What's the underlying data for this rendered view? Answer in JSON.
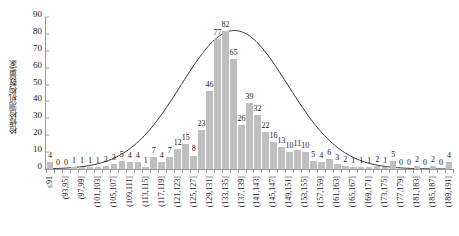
{
  "chart_data": {
    "type": "bar",
    "title": "",
    "xlabel": "",
    "ylabel": "检修检测机构数量/家",
    "ylim": [
      0,
      90
    ],
    "yticks": [
      0,
      10,
      20,
      30,
      40,
      50,
      60,
      70,
      80,
      90
    ],
    "grid": false,
    "legend": null,
    "bar_color": "#bfbfbf",
    "curve_color": "#333333",
    "categories": [
      "≤91",
      "(91,93]",
      "(93,95]",
      "(95,97]",
      "(97,99]",
      "(99,101]",
      "(101,103]",
      "(103,105]",
      "(105,107]",
      "(107,109]",
      "(109,111]",
      "(111,113]",
      "(113,115]",
      "(115,117]",
      "(117,119]",
      "(119,121]",
      "(121,123]",
      "(123,125]",
      "(125,127]",
      "(127,129]",
      "(129,131]",
      "(131,133]",
      "(133,135]",
      "(135,137]",
      "(137,139]",
      "(139,141]",
      "(141,143]",
      "(143,145]",
      "(145,147]",
      "(147,149]",
      "(149,151]",
      "(151,153]",
      "(153,155]",
      "(155,157]",
      "(157,159]",
      "(159,161]",
      "(161,163]",
      "(163,165]",
      "(165,167]",
      "(167,169]",
      "(169,171]",
      "(171,173]",
      "(173,175]",
      "(175,177]",
      "(177,179]",
      "(179,181]",
      "(181,183]",
      "(183,185]",
      "(185,187]",
      "(187,189]",
      "(189,191]"
    ],
    "visible_tick_labels": [
      "≤91",
      "(93,95]",
      "(97,99]",
      "(101,103]",
      "(105,107]",
      "(109,111]",
      "(113,115]",
      "(117,119]",
      "(121,123]",
      "(125,127]",
      "(129,131]",
      "(133,135]",
      "(137,139]",
      "(141,143]",
      "(145,147]",
      "(149,151]",
      "(153,155]",
      "(157,159]",
      "(161,163]",
      "(165,167]",
      "(169,171]",
      "(173,175]",
      "(177,179]",
      "(181,183]",
      "(185,187]",
      "(189,191]"
    ],
    "values": [
      4,
      0,
      0,
      1,
      1,
      1,
      1,
      2,
      3,
      5,
      4,
      4,
      1,
      7,
      4,
      7,
      12,
      15,
      8,
      23,
      46,
      77,
      82,
      65,
      26,
      39,
      32,
      22,
      16,
      13,
      10,
      11,
      10,
      5,
      4,
      6,
      3,
      2,
      1,
      1,
      1,
      2,
      1,
      5,
      0,
      0,
      2,
      0,
      2,
      0,
      4
    ],
    "normal_curve": {
      "description": "fitted normal distribution overlay",
      "peak_value": 82,
      "peak_category_index": 22
    }
  }
}
